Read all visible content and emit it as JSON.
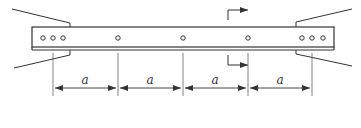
{
  "diagram": {
    "type": "beam-with-bolt-spacing",
    "stroke_color": "#333333",
    "dimension_color": "#555555",
    "beam": {
      "x1": 32,
      "x2": 334,
      "top": 27,
      "bottom": 47,
      "bottom2": 50
    },
    "holes": {
      "y": 38,
      "left_group": [
        43,
        53,
        63
      ],
      "middle": [
        118,
        183,
        248
      ],
      "right_group": [
        302,
        312,
        323
      ]
    },
    "dimension": {
      "extension_lines_x": [
        53,
        118,
        183,
        248,
        312
      ],
      "arrow_y": 88,
      "segments": [
        {
          "label": "a"
        },
        {
          "label": "a"
        },
        {
          "label": "a"
        },
        {
          "label": "a"
        }
      ]
    },
    "section_marker": {
      "x": 228,
      "top_y": [
        10,
        20
      ],
      "bottom_y": [
        56,
        66
      ],
      "direction": "right"
    }
  }
}
